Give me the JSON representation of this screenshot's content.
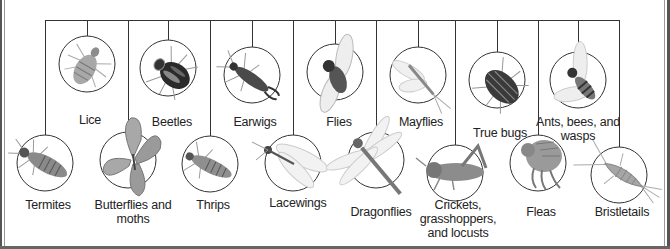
{
  "colors": {
    "line": "#333333",
    "circle": "#333333",
    "text": "#222222",
    "background": "#ffffff"
  },
  "upper_row": [
    {
      "id": "lice",
      "label": "Lice",
      "icon": "louse-icon"
    },
    {
      "id": "beetles",
      "label": "Beetles",
      "icon": "beetle-icon"
    },
    {
      "id": "earwigs",
      "label": "Earwigs",
      "icon": "earwig-icon"
    },
    {
      "id": "flies",
      "label": "Flies",
      "icon": "fly-icon"
    },
    {
      "id": "mayflies",
      "label": "Mayflies",
      "icon": "mayfly-icon"
    },
    {
      "id": "true-bugs",
      "label": "True bugs",
      "icon": "stink-bug-icon"
    },
    {
      "id": "ants-bees-wasps",
      "label_lines": [
        "Ants, bees, and",
        "wasps"
      ],
      "icon": "wasp-icon"
    }
  ],
  "lower_row": [
    {
      "id": "termites",
      "label": "Termites",
      "icon": "termite-icon"
    },
    {
      "id": "butterflies-moths",
      "label_lines": [
        "Butterflies and",
        "moths"
      ],
      "icon": "butterfly-icon"
    },
    {
      "id": "thrips",
      "label": "Thrips",
      "icon": "thrips-icon"
    },
    {
      "id": "lacewings",
      "label": "Lacewings",
      "icon": "lacewing-icon"
    },
    {
      "id": "dragonflies",
      "label": "Dragonflies",
      "icon": "dragonfly-icon"
    },
    {
      "id": "crickets",
      "label_lines": [
        "Crickets,",
        "grasshoppers,",
        "and locusts"
      ],
      "icon": "cricket-icon"
    },
    {
      "id": "fleas",
      "label": "Fleas",
      "icon": "flea-icon"
    },
    {
      "id": "bristletails",
      "label": "Bristletails",
      "icon": "silverfish-icon"
    }
  ]
}
